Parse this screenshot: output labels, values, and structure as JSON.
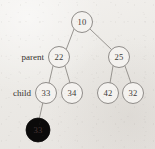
{
  "figure": {
    "kind": "binary-heap-tree-diagram",
    "canvas": {
      "width": 155,
      "height": 149
    },
    "background_color": "#eeece9",
    "node_fill": "#f4f2ef",
    "node_stroke": "#8a8784",
    "highlight_fill": "#0b0a0a",
    "edge_color": "#8d8a86",
    "node_radius": 10.5
  },
  "labels": [
    {
      "id": "label-parent",
      "text": "parent",
      "x": 44,
      "y": 57
    },
    {
      "id": "label-child",
      "text": "child",
      "x": 31,
      "y": 93
    }
  ],
  "nodes": [
    {
      "id": "node-root-10",
      "value": "10",
      "x": 82,
      "y": 22,
      "level": 0,
      "highlighted": false
    },
    {
      "id": "node-22",
      "value": "22",
      "x": 59,
      "y": 57,
      "level": 1,
      "highlighted": false
    },
    {
      "id": "node-25",
      "value": "25",
      "x": 119,
      "y": 57,
      "level": 1,
      "highlighted": false
    },
    {
      "id": "node-33",
      "value": "33",
      "x": 46,
      "y": 93,
      "level": 2,
      "highlighted": false
    },
    {
      "id": "node-34",
      "value": "34",
      "x": 72,
      "y": 93,
      "level": 2,
      "highlighted": false
    },
    {
      "id": "node-42",
      "value": "42",
      "x": 108,
      "y": 93,
      "level": 2,
      "highlighted": false
    },
    {
      "id": "node-32",
      "value": "32",
      "x": 133,
      "y": 93,
      "level": 2,
      "highlighted": false
    },
    {
      "id": "node-33-highlight",
      "value": "33",
      "x": 38,
      "y": 130,
      "level": 3,
      "highlighted": true
    }
  ],
  "edges": [
    {
      "id": "edge-10-22",
      "from": "node-root-10",
      "to": "node-22",
      "x1": 74,
      "y1": 29,
      "x2": 66,
      "y2": 50
    },
    {
      "id": "edge-10-25",
      "from": "node-root-10",
      "to": "node-25",
      "x1": 90,
      "y1": 29,
      "x2": 112,
      "y2": 50
    },
    {
      "id": "edge-22-33",
      "from": "node-22",
      "to": "node-33",
      "x1": 53,
      "y1": 66,
      "x2": 49,
      "y2": 83
    },
    {
      "id": "edge-22-34",
      "from": "node-22",
      "to": "node-34",
      "x1": 65,
      "y1": 66,
      "x2": 70,
      "y2": 83
    },
    {
      "id": "edge-25-42",
      "from": "node-25",
      "to": "node-42",
      "x1": 113,
      "y1": 66,
      "x2": 110,
      "y2": 83
    },
    {
      "id": "edge-25-32",
      "from": "node-25",
      "to": "node-32",
      "x1": 125,
      "y1": 66,
      "x2": 131,
      "y2": 83
    },
    {
      "id": "edge-33-33",
      "from": "node-33",
      "to": "node-33-highlight",
      "x1": 43,
      "y1": 102,
      "x2": 39,
      "y2": 120
    }
  ]
}
